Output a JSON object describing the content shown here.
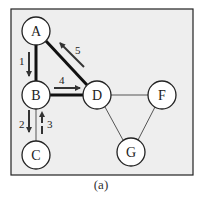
{
  "figure": {
    "caption": "(a)",
    "background": "#eeeeee",
    "border_color": "#222222"
  },
  "nodes": [
    {
      "id": "A",
      "label": "A",
      "x": 36,
      "y": 31
    },
    {
      "id": "B",
      "label": "B",
      "x": 36,
      "y": 95
    },
    {
      "id": "C",
      "label": "C",
      "x": 36,
      "y": 155
    },
    {
      "id": "D",
      "label": "D",
      "x": 97,
      "y": 95
    },
    {
      "id": "F",
      "label": "F",
      "x": 162,
      "y": 95
    },
    {
      "id": "G",
      "label": "G",
      "x": 131,
      "y": 152
    }
  ],
  "edges": [
    {
      "from": "A",
      "to": "B",
      "style": "thick"
    },
    {
      "from": "A",
      "to": "D",
      "style": "thick"
    },
    {
      "from": "B",
      "to": "D",
      "style": "thick"
    },
    {
      "from": "B",
      "to": "C",
      "style": "thin"
    },
    {
      "from": "D",
      "to": "F",
      "style": "thin"
    },
    {
      "from": "D",
      "to": "G",
      "style": "thin"
    },
    {
      "from": "F",
      "to": "G",
      "style": "thin"
    }
  ],
  "traversal_arrows": [
    {
      "step": "1",
      "from": "A",
      "to": "B"
    },
    {
      "step": "2",
      "from": "B",
      "to": "C"
    },
    {
      "step": "3",
      "from": "C",
      "to": "B"
    },
    {
      "step": "4",
      "from": "B",
      "to": "D"
    },
    {
      "step": "5",
      "from": "D",
      "to": "A"
    }
  ]
}
